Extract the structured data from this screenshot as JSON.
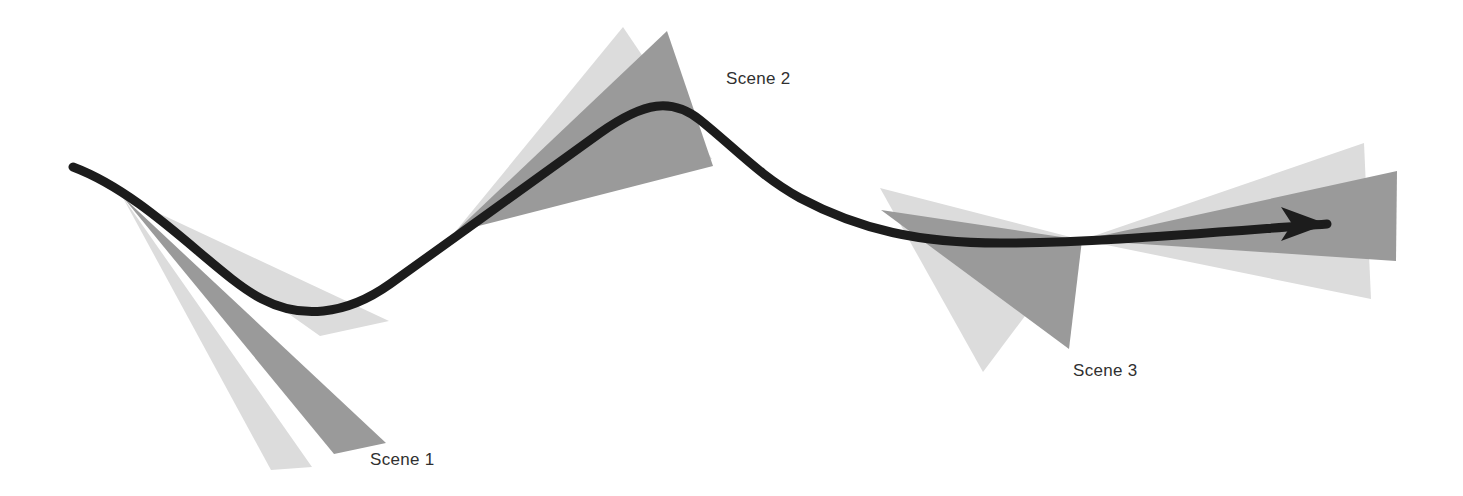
{
  "figure": {
    "title": "",
    "background_color": "#ffffff",
    "width": 1463,
    "height": 496
  },
  "trajectory": {
    "name": "trajectory-curve",
    "color": "#1c1c1c",
    "stroke_width": 9,
    "arrow_head": {
      "name": "arrow-head",
      "color": "#1c1c1c",
      "tip_x": 1327,
      "tip_y": 224
    },
    "path": "M 73 167 C 150 196 215 275 262 299 C 300 319 345 316 390 284 C 460 234 520 190 600 133 C 645 101 672 98 700 120 C 735 148 760 176 800 198 C 860 230 920 243 1000 243 C 1090 243 1180 235 1327 224"
  },
  "scenes": [
    {
      "id": "scene-1",
      "label": "Scene 1",
      "label_x": 370,
      "label_y": 450,
      "cones": [
        {
          "id": "scene-1-cone-light",
          "tone": "light",
          "color": "#dcdcdc",
          "points": "122,196 312,467 271,470"
        },
        {
          "id": "scene-1-cone-dark",
          "tone": "dark",
          "color": "#9a9a9a",
          "points": "122,196 386,443 334,454"
        },
        {
          "id": "scene-1-cone-light-upper",
          "tone": "light",
          "color": "#dcdcdc",
          "points": "122,196 389,321 320,336"
        }
      ]
    },
    {
      "id": "scene-2",
      "label": "Scene 2",
      "label_x": 726,
      "label_y": 69,
      "cones": [
        {
          "id": "scene-2-cone-light",
          "tone": "light",
          "color": "#dcdcdc",
          "points": "455,232 623,27 712,159"
        },
        {
          "id": "scene-2-cone-dark",
          "tone": "dark",
          "color": "#9a9a9a",
          "points": "455,232 667,31 713,166"
        }
      ]
    },
    {
      "id": "scene-3",
      "label": "Scene 3",
      "label_x": 1073,
      "label_y": 361,
      "cones": [
        {
          "id": "scene-3-cone-left-light",
          "tone": "light",
          "color": "#dcdcdc",
          "points": "1082,240 880,188 983,372"
        },
        {
          "id": "scene-3-cone-left-dark",
          "tone": "dark",
          "color": "#9a9a9a",
          "points": "1082,240 881,210 1069,349"
        },
        {
          "id": "scene-3-cone-right-light",
          "tone": "light",
          "color": "#dcdcdc",
          "points": "1082,240 1364,143 1371,299"
        },
        {
          "id": "scene-3-cone-right-dark",
          "tone": "dark",
          "color": "#9a9a9a",
          "points": "1082,240 1397,171 1396,261"
        }
      ]
    }
  ],
  "palette": {
    "curve": "#1c1c1c",
    "cone_light": "#dcdcdc",
    "cone_dark": "#9a9a9a",
    "label_text": "#303030",
    "background": "#ffffff"
  }
}
